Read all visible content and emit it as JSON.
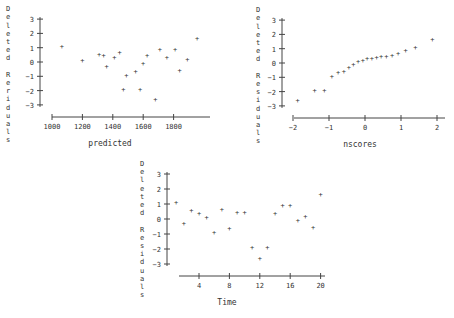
{
  "chart_data": [
    {
      "type": "scatter",
      "title": "",
      "xlabel": "predicted",
      "ylabel": "Deleted Residuals",
      "xticks": [
        1000,
        1200,
        1400,
        1600,
        1800
      ],
      "yticks": [
        3,
        2,
        1,
        0,
        -1,
        -2,
        -3
      ],
      "xlim": [
        980,
        1980
      ],
      "ylim": [
        -3.4,
        3.2
      ],
      "grid": false,
      "points": [
        {
          "x": 1065,
          "y": 1.1
        },
        {
          "x": 1200,
          "y": 0.1
        },
        {
          "x": 1310,
          "y": 0.55
        },
        {
          "x": 1340,
          "y": 0.45
        },
        {
          "x": 1360,
          "y": -0.3
        },
        {
          "x": 1410,
          "y": 0.3
        },
        {
          "x": 1445,
          "y": 0.65
        },
        {
          "x": 1470,
          "y": -1.9
        },
        {
          "x": 1490,
          "y": -0.95
        },
        {
          "x": 1550,
          "y": -0.65
        },
        {
          "x": 1580,
          "y": -1.9
        },
        {
          "x": 1600,
          "y": -0.1
        },
        {
          "x": 1625,
          "y": 0.45
        },
        {
          "x": 1680,
          "y": -2.6
        },
        {
          "x": 1710,
          "y": 0.85
        },
        {
          "x": 1755,
          "y": 0.3
        },
        {
          "x": 1810,
          "y": 0.85
        },
        {
          "x": 1840,
          "y": -0.6
        },
        {
          "x": 1890,
          "y": 0.15
        },
        {
          "x": 1955,
          "y": 1.65
        }
      ]
    },
    {
      "type": "scatter",
      "title": "",
      "xlabel": "nscores",
      "ylabel": "Residuals",
      "xticks": [
        -2,
        -1,
        0,
        1,
        2
      ],
      "yticks": [
        3,
        2,
        1,
        0,
        -1,
        -2,
        -3
      ],
      "xlim": [
        -2.3,
        2.3
      ],
      "ylim": [
        -3.4,
        3.2
      ],
      "grid": false,
      "points": [
        {
          "x": -1.87,
          "y": -2.6
        },
        {
          "x": -1.4,
          "y": -1.9
        },
        {
          "x": -1.13,
          "y": -1.9
        },
        {
          "x": -0.92,
          "y": -0.95
        },
        {
          "x": -0.75,
          "y": -0.65
        },
        {
          "x": -0.59,
          "y": -0.6
        },
        {
          "x": -0.45,
          "y": -0.3
        },
        {
          "x": -0.32,
          "y": -0.1
        },
        {
          "x": -0.19,
          "y": 0.1
        },
        {
          "x": -0.06,
          "y": 0.15
        },
        {
          "x": 0.06,
          "y": 0.3
        },
        {
          "x": 0.19,
          "y": 0.3
        },
        {
          "x": 0.32,
          "y": 0.35
        },
        {
          "x": 0.45,
          "y": 0.45
        },
        {
          "x": 0.59,
          "y": 0.45
        },
        {
          "x": 0.75,
          "y": 0.55
        },
        {
          "x": 0.92,
          "y": 0.65
        },
        {
          "x": 1.13,
          "y": 0.85
        },
        {
          "x": 1.4,
          "y": 1.05
        },
        {
          "x": 1.87,
          "y": 1.65
        }
      ]
    },
    {
      "type": "scatter",
      "title": "",
      "xlabel": "Time",
      "ylabel": "Deleted Residuals",
      "xticks": [
        4,
        8,
        12,
        16,
        20
      ],
      "yticks": [
        3,
        2,
        1,
        0,
        -1,
        -2,
        -3
      ],
      "xlim": [
        0,
        21
      ],
      "ylim": [
        -3.4,
        3.2
      ],
      "grid": false,
      "points": [
        {
          "x": 1,
          "y": 1.1
        },
        {
          "x": 2,
          "y": -0.3
        },
        {
          "x": 3,
          "y": 0.6
        },
        {
          "x": 4,
          "y": 0.35
        },
        {
          "x": 5,
          "y": 0.1
        },
        {
          "x": 6,
          "y": -0.9
        },
        {
          "x": 7,
          "y": 0.65
        },
        {
          "x": 8,
          "y": -0.6
        },
        {
          "x": 9,
          "y": 0.45
        },
        {
          "x": 10,
          "y": 0.45
        },
        {
          "x": 11,
          "y": -1.9
        },
        {
          "x": 12,
          "y": -2.6
        },
        {
          "x": 13,
          "y": -1.9
        },
        {
          "x": 14,
          "y": 0.35
        },
        {
          "x": 15,
          "y": 0.9
        },
        {
          "x": 16,
          "y": 0.9
        },
        {
          "x": 17,
          "y": -0.1
        },
        {
          "x": 18,
          "y": 0.2
        },
        {
          "x": 19,
          "y": -0.55
        },
        {
          "x": 20,
          "y": 1.65
        }
      ]
    }
  ],
  "plots": [
    {
      "ylabel_chars": [
        "D",
        "e",
        "l",
        "e",
        "t",
        "e",
        "d",
        "",
        "R",
        "e",
        "r",
        "i",
        "d",
        "u",
        "a",
        "l",
        "s"
      ],
      "xlabel": "predicted"
    },
    {
      "ylabel_chars": [
        "D",
        "e",
        "l",
        "e",
        "t",
        "e",
        "d",
        "",
        "R",
        "e",
        "s",
        "i",
        "d",
        "u",
        "a",
        "l",
        "s"
      ],
      "xlabel": "nscores"
    },
    {
      "ylabel_chars": [
        "D",
        "e",
        "l",
        "e",
        "t",
        "e",
        "d",
        "",
        "R",
        "e",
        "s",
        "i",
        "d",
        "u",
        "a",
        "l",
        "s"
      ],
      "xlabel": "Time"
    }
  ]
}
